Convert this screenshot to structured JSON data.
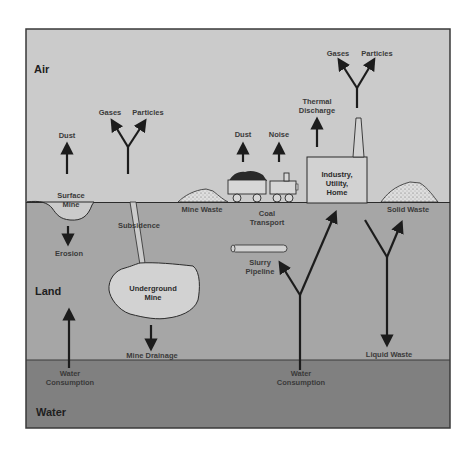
{
  "diagram": {
    "colors": {
      "air": "#cbcbcb",
      "land": "#a6a6a6",
      "water": "#808080",
      "frame": "#3a3a3a",
      "arrow": "#1c1c1c",
      "pile": "#dcdcdc",
      "structure_fill": "#d2d2d2"
    },
    "zones": {
      "air": "Air",
      "land": "Land",
      "water": "Water"
    },
    "labels": {
      "dust_mine": "Dust",
      "gases_mine": "Gases",
      "particles_mine": "Particles",
      "surface_mine": "Surface\nMine",
      "erosion": "Erosion",
      "subsidence": "Subsidence",
      "underground_mine": "Underground\nMine",
      "mine_drainage": "Mine Drainage",
      "water_consumption_left": "Water\nConsumption",
      "mine_waste": "Mine Waste",
      "dust_train": "Dust",
      "noise": "Noise",
      "coal_transport": "Coal\nTransport",
      "slurry_pipeline": "Slurry\nPipeline",
      "thermal_discharge": "Thermal\nDischarge",
      "gases_stack": "Gases",
      "particles_stack": "Particles",
      "industry": "Industry,\nUtility,\nHome",
      "solid_waste": "Solid Waste",
      "water_consumption_right": "Water\nConsumption",
      "liquid_waste": "Liquid Waste"
    }
  }
}
